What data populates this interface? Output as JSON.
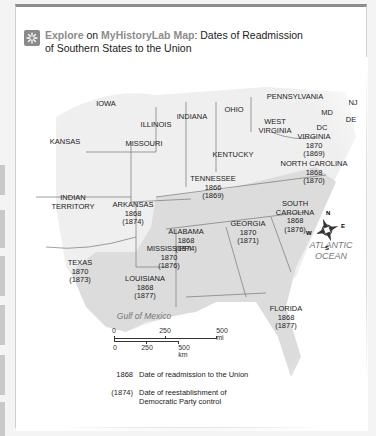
{
  "header": {
    "icon": "explore-burst-icon",
    "explore_label": "Explore",
    "on_label": "on",
    "source_label": "MyHistoryLab Map",
    "title_line1": ": Dates of Readmission",
    "title_line2": "of Southern States to the Union"
  },
  "colors": {
    "frame_top": "#8e8e8e",
    "accent_gray": "#8c8c8c",
    "southern_fill": "#d9d9d9",
    "northern_fill": "#f2f2f2",
    "water": "#ffffff"
  },
  "states": {
    "iowa": {
      "name": "IOWA"
    },
    "illinois": {
      "name": "ILLINOIS"
    },
    "indiana": {
      "name": "INDIANA"
    },
    "ohio": {
      "name": "OHIO"
    },
    "pennsylvania": {
      "name": "PENNSYLVANIA"
    },
    "nj": {
      "name": "NJ"
    },
    "md": {
      "name": "MD"
    },
    "de": {
      "name": "DE"
    },
    "dc": {
      "name": "DC"
    },
    "west_virginia": {
      "name1": "WEST",
      "name2": "VIRGINIA"
    },
    "virginia": {
      "name": "VIRGINIA",
      "readmitted": "1870",
      "democratic": "(1869)"
    },
    "kansas": {
      "name": "KANSAS"
    },
    "missouri": {
      "name": "MISSOURI"
    },
    "kentucky": {
      "name": "KENTUCKY"
    },
    "north_carolina": {
      "name": "NORTH CAROLINA",
      "readmitted": "1868",
      "democratic": "(1870)"
    },
    "tennessee": {
      "name": "TENNESSEE",
      "readmitted": "1866",
      "democratic": "(1869)"
    },
    "indian_territory": {
      "name1": "INDIAN",
      "name2": "TERRITORY"
    },
    "arkansas": {
      "name": "ARKANSAS",
      "readmitted": "1868",
      "democratic": "(1874)"
    },
    "south_carolina": {
      "name1": "SOUTH",
      "name2": "CAROLINA",
      "readmitted": "1868",
      "democratic": "(1876)"
    },
    "alabama": {
      "name": "ALABAMA",
      "readmitted": "1868",
      "democratic": "(1874)"
    },
    "georgia": {
      "name": "GEORGIA",
      "readmitted": "1870",
      "democratic": "(1871)"
    },
    "mississippi": {
      "name": "MISSISSIPPI",
      "readmitted": "1870",
      "democratic": "(1876)"
    },
    "texas": {
      "name": "TEXAS",
      "readmitted": "1870",
      "democratic": "(1873)"
    },
    "louisiana": {
      "name": "LOUISIANA",
      "readmitted": "1868",
      "democratic": "(1877)"
    },
    "florida": {
      "name": "FLORIDA",
      "readmitted": "1868",
      "democratic": "(1877)"
    }
  },
  "water": {
    "atlantic1": "ATLANTIC",
    "atlantic2": "OCEAN",
    "gulf": "Gulf of Mexico"
  },
  "compass": {
    "n": "N",
    "e": "E",
    "s": "S",
    "w": "W"
  },
  "scale": {
    "mi": [
      "0",
      "250",
      "500 mi"
    ],
    "km": [
      "0",
      "250",
      "500 km"
    ]
  },
  "legend": {
    "readmit_key": "1868",
    "readmit_text": "Date of readmission to the Union",
    "dem_key": "(1874)",
    "dem_text1": "Date of reestablishment of",
    "dem_text2": "Democratic Party control"
  }
}
